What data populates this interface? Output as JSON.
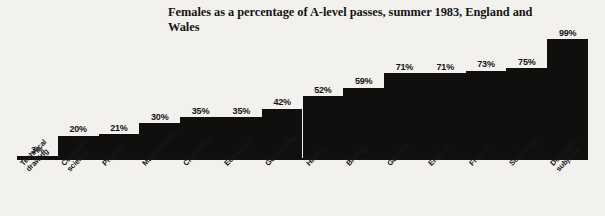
{
  "chart_data": {
    "type": "bar",
    "title": "Females as a percentage of A-level passes, summer 1983, England and Wales",
    "xlabel": "",
    "ylabel": "",
    "ylim": [
      0,
      100
    ],
    "grid": false,
    "legend": "none",
    "orientation": "vertical",
    "bar_color": "#100f0d",
    "background_color": "#f2f1ee",
    "value_label_suffix": "%",
    "categories": [
      "Technical\ndrawing",
      "Computer\nscience",
      "Physics",
      "Mathematics",
      "Chemistry",
      "Economics",
      "Geography",
      "History",
      "Biology",
      "German",
      "English",
      "French",
      "Sociology",
      "Domestic\nsubjects"
    ],
    "values": [
      3,
      20,
      21,
      30,
      35,
      35,
      42,
      52,
      59,
      71,
      71,
      73,
      75,
      99
    ],
    "value_labels": [
      "3%",
      "20%",
      "21%",
      "30%",
      "35%",
      "35%",
      "42%",
      "52%",
      "59%",
      "71%",
      "71%",
      "73%",
      "75%",
      "99%"
    ]
  }
}
